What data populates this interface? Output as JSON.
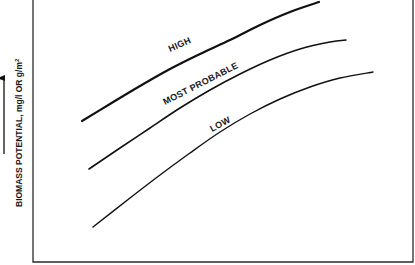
{
  "chart_data": {
    "type": "line",
    "title": "",
    "xlabel": "",
    "ylabel": "BIOMASS POTENTIAL, mg/l OR g/m²",
    "ylabel_arrow": "up-arrow",
    "grid": false,
    "legend": "inline curve labels",
    "coordinate_note": "Schematic chart without numeric ticks; points are pixel positions in the 415x265 figure (y down).",
    "frame": {
      "left": 33,
      "top": 0,
      "right": 413,
      "bottom": 262
    },
    "series": [
      {
        "name": "HIGH",
        "stroke_width": 2.2,
        "points": [
          [
            82,
            121
          ],
          [
            110,
            104
          ],
          [
            140,
            86
          ],
          [
            170,
            69
          ],
          [
            200,
            54
          ],
          [
            230,
            40
          ],
          [
            260,
            25
          ],
          [
            290,
            12
          ],
          [
            319,
            2
          ]
        ],
        "label_pos": [
          182,
          50
        ],
        "label_angle": -25
      },
      {
        "name": "MOST PROBABLE",
        "stroke_width": 1.6,
        "points": [
          [
            89,
            169
          ],
          [
            120,
            148
          ],
          [
            150,
            128
          ],
          [
            180,
            108
          ],
          [
            210,
            90
          ],
          [
            240,
            74
          ],
          [
            270,
            60
          ],
          [
            300,
            49
          ],
          [
            330,
            42
          ],
          [
            346,
            40
          ]
        ],
        "label_pos": [
          167,
          106
        ],
        "label_angle": -27
      },
      {
        "name": "LOW",
        "stroke_width": 1.4,
        "points": [
          [
            93,
            227
          ],
          [
            130,
            198
          ],
          [
            160,
            175
          ],
          [
            190,
            153
          ],
          [
            220,
            132
          ],
          [
            250,
            114
          ],
          [
            280,
            99
          ],
          [
            310,
            87
          ],
          [
            340,
            78
          ],
          [
            373,
            72
          ]
        ],
        "label_pos": [
          213,
          131
        ],
        "label_angle": -27
      }
    ]
  },
  "labels": {
    "high": "HIGH",
    "most_probable": "MOST PROBABLE",
    "low": "LOW",
    "ylabel_main": "BIOMASS POTENTIAL, mg/l OR g/m",
    "ylabel_sup": "2"
  }
}
